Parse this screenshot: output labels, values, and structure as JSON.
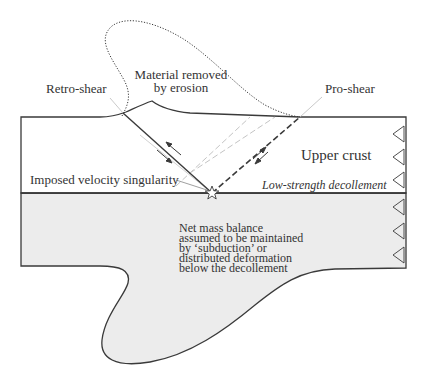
{
  "diagram": {
    "labels": {
      "retro_shear": "Retro-shear",
      "material_removed_line1": "Material removed",
      "material_removed_line2": "by erosion",
      "pro_shear": "Pro-shear",
      "upper_crust": "Upper crust",
      "velocity_singularity": "Imposed velocity singularity",
      "decollement": "Low-strength decollement",
      "mass_balance": [
        "Net mass balance",
        "assumed to be maintained",
        "by ‘subduction’ or",
        "distributed deformation",
        "below the decollement"
      ]
    },
    "colors": {
      "outline": "#3a3a3a",
      "lower_fill": "#ececec",
      "construction_lines": "#c4c4c4",
      "text": "#333333"
    },
    "boundary_arrows_count": 6
  }
}
